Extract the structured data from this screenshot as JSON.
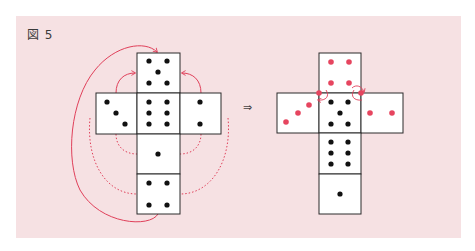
{
  "figure": {
    "label": "図 5",
    "transform_arrow": "⇒"
  },
  "colors": {
    "panel_bg": "#f6e1e3",
    "face_bg": "#ffffff",
    "border": "#2a2a2a",
    "pip_black": "#111111",
    "pip_red": "#e6455f",
    "arc_red": "#e0405a"
  },
  "left_net": {
    "description": "Unfolded die net; arrows indicate folding",
    "faces": [
      {
        "position": "top",
        "pips": 5
      },
      {
        "position": "left",
        "pips": 3
      },
      {
        "position": "center",
        "pips": 6
      },
      {
        "position": "right",
        "pips": 2
      },
      {
        "position": "below-center",
        "pips": 1
      },
      {
        "position": "bottom",
        "pips": 4
      }
    ],
    "arcs": [
      {
        "type": "solid",
        "from": "bottom",
        "to": "top"
      },
      {
        "type": "solid",
        "from": "left",
        "to": "top"
      },
      {
        "type": "solid",
        "from": "right",
        "to": "top"
      },
      {
        "type": "dotted",
        "from": "left",
        "to": "below-center"
      },
      {
        "type": "dotted",
        "from": "right",
        "to": "below-center"
      },
      {
        "type": "dotted",
        "from": "left",
        "to": "bottom"
      },
      {
        "type": "dotted",
        "from": "right",
        "to": "bottom"
      }
    ]
  },
  "right_net": {
    "description": "Rearranged net with red pips marking faces shared at corners",
    "faces": [
      {
        "position": "top",
        "pips": 4,
        "color": "red"
      },
      {
        "position": "left",
        "pips": 3,
        "color": "red"
      },
      {
        "position": "center",
        "pips": 5,
        "color": "black"
      },
      {
        "position": "right",
        "pips": 2,
        "color": "red"
      },
      {
        "position": "below-center",
        "pips": 6,
        "color": "black"
      },
      {
        "position": "bottom",
        "pips": 1,
        "color": "black"
      }
    ]
  }
}
